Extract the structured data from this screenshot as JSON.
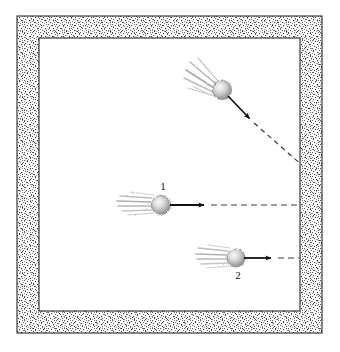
{
  "figure": {
    "caption": "",
    "background_color": "#ffffff",
    "wall": {
      "name": "stippled-wall-frame",
      "fill_pattern": "stipple-dots",
      "stipple_color": "#4a4a4a",
      "outline_color": "#2b2b2b",
      "outer": {
        "x": 17,
        "y": 16,
        "width": 305,
        "height": 317
      },
      "inner": {
        "x": 39,
        "y": 38,
        "width": 261,
        "height": 273
      }
    },
    "chamber": {
      "name": "inner-chamber",
      "fill_color": "#ffffff"
    },
    "objects": [
      {
        "id": "ball-top",
        "name": "comet-ball-diagonal",
        "label": "",
        "label_position": "none",
        "head": {
          "cx": 222,
          "cy": 90,
          "r": 9.5
        },
        "head_color": "#9a9a9a",
        "trail_direction_degrees": 215,
        "trail_length": 34,
        "arrow": {
          "name": "velocity-arrow-diagonal",
          "from": {
            "x": 228,
            "y": 96
          },
          "to": {
            "x": 252,
            "y": 121
          },
          "color": "#111111",
          "style": "solid",
          "arrowhead": true
        },
        "dashed_path": {
          "name": "trajectory-dashed-diagonal",
          "from": {
            "x": 252,
            "y": 121
          },
          "to": {
            "x": 300,
            "y": 163
          },
          "color": "#3a3a3a",
          "style": "dashed"
        }
      },
      {
        "id": "ball-1",
        "name": "comet-ball-1",
        "label": "1",
        "label_position": {
          "x": 163,
          "y": 190
        },
        "head": {
          "cx": 161,
          "cy": 205,
          "r": 9.5
        },
        "head_color": "#9a9a9a",
        "trail_direction_degrees": 180,
        "trail_length": 36,
        "arrow": {
          "name": "velocity-arrow-1",
          "from": {
            "x": 170,
            "y": 205
          },
          "to": {
            "x": 207,
            "y": 205
          },
          "color": "#111111",
          "style": "solid",
          "arrowhead": true
        },
        "dashed_path": {
          "name": "trajectory-dashed-1",
          "from": {
            "x": 207,
            "y": 205
          },
          "to": {
            "x": 300,
            "y": 205
          },
          "color": "#3a3a3a",
          "style": "dashed"
        }
      },
      {
        "id": "ball-2",
        "name": "comet-ball-2",
        "label": "2",
        "label_position": {
          "x": 238,
          "y": 278
        },
        "head": {
          "cx": 236,
          "cy": 258,
          "r": 9.0
        },
        "head_color": "#9a9a9a",
        "trail_direction_degrees": 180,
        "trail_length": 34,
        "arrow": {
          "name": "velocity-arrow-2",
          "from": {
            "x": 244,
            "y": 258
          },
          "to": {
            "x": 274,
            "y": 258
          },
          "color": "#111111",
          "style": "solid",
          "arrowhead": true
        },
        "dashed_path": {
          "name": "trajectory-dashed-2",
          "from": {
            "x": 274,
            "y": 258
          },
          "to": {
            "x": 300,
            "y": 258
          },
          "color": "#3a3a3a",
          "style": "dashed"
        }
      }
    ]
  }
}
